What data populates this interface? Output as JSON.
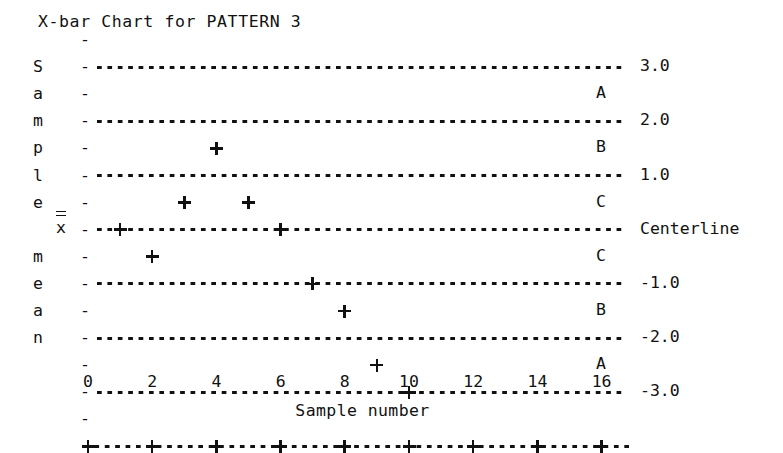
{
  "title": "X-bar Chart for PATTERN 3",
  "axes": {
    "y_caption": "Sample mean",
    "y_caption_letters": [
      "S",
      "a",
      "m",
      "p",
      "l",
      "e",
      "",
      "m",
      "e",
      "a",
      "n"
    ],
    "y_symbol": "x",
    "x_title": "Sample number",
    "x_ticks": [
      "0",
      "2",
      "4",
      "6",
      "8",
      "10",
      "12",
      "14",
      "16"
    ]
  },
  "gridline_labels": [
    "3.0",
    "2.0",
    "1.0",
    "Centerline",
    "-1.0",
    "-2.0",
    "-3.0"
  ],
  "zone_labels": [
    "A",
    "B",
    "C",
    "C",
    "B",
    "A"
  ],
  "marker": "+",
  "colors": {
    "ink": "#111111",
    "background": "#ffffff"
  },
  "chart_data": {
    "type": "scatter",
    "title": "X-bar Chart for PATTERN 3",
    "xlabel": "Sample number",
    "ylabel": "Sample mean",
    "grid": true,
    "legend": "none",
    "xlim": [
      0,
      16.5
    ],
    "ylim": [
      -3.5,
      3.5
    ],
    "xticks": [
      0,
      2,
      4,
      6,
      8,
      10,
      12,
      14,
      16
    ],
    "control_limits": [
      {
        "label": "3.0",
        "value": 3.0
      },
      {
        "label": "2.0",
        "value": 2.0
      },
      {
        "label": "1.0",
        "value": 1.0
      },
      {
        "label": "Centerline",
        "value": 0.0
      },
      {
        "label": "-1.0",
        "value": -1.0
      },
      {
        "label": "-2.0",
        "value": -2.0
      },
      {
        "label": "-3.0",
        "value": -3.0
      }
    ],
    "zones": [
      {
        "label": "A",
        "center": 2.5
      },
      {
        "label": "B",
        "center": 1.5
      },
      {
        "label": "C",
        "center": 0.5
      },
      {
        "label": "C",
        "center": -0.5
      },
      {
        "label": "B",
        "center": -1.5
      },
      {
        "label": "A",
        "center": -2.5
      }
    ],
    "x": [
      1,
      2,
      3,
      4,
      5,
      6,
      7,
      8,
      9,
      10
    ],
    "y": [
      0.0,
      -0.5,
      0.5,
      1.5,
      0.5,
      0.0,
      -1.0,
      -1.5,
      -2.5,
      -3.0
    ],
    "points": [
      {
        "sample": 1,
        "value": 0.0
      },
      {
        "sample": 2,
        "value": -0.5
      },
      {
        "sample": 3,
        "value": 0.5
      },
      {
        "sample": 4,
        "value": 1.5
      },
      {
        "sample": 5,
        "value": 0.5
      },
      {
        "sample": 6,
        "value": 0.0
      },
      {
        "sample": 7,
        "value": -1.0
      },
      {
        "sample": 8,
        "value": -1.5
      },
      {
        "sample": 9,
        "value": -2.5
      },
      {
        "sample": 10,
        "value": -3.0
      }
    ]
  }
}
